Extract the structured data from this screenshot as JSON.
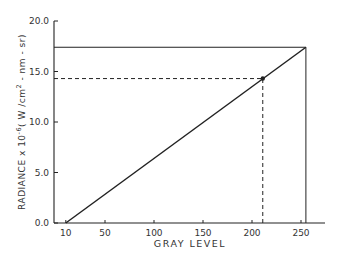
{
  "chart_data": {
    "type": "line",
    "title": "",
    "xlabel": "GRAY LEVEL",
    "ylabel": "RADIANCE x 10^-6 (W/cm^2-nm-sr)",
    "ylabel_parts": {
      "main": "RADIANCE x 10",
      "exp": "-6",
      "unit_open": "( W /cm",
      "unit_exp": "2",
      "unit_rest": " - nm - sr)"
    },
    "xlim": [
      0,
      270
    ],
    "ylim": [
      0,
      20
    ],
    "x_ticks": [
      10,
      50,
      100,
      150,
      200,
      250
    ],
    "x_tick_labels": [
      "10",
      "50",
      "100",
      "150",
      "200",
      "250"
    ],
    "y_ticks": [
      0,
      5,
      10,
      15,
      20
    ],
    "y_tick_labels": [
      "0.0",
      "5.0",
      "10.0",
      "15.0",
      "20.0"
    ],
    "grid": false,
    "legend": null,
    "series": [
      {
        "name": "calibration",
        "style": "solid",
        "x": [
          10,
          255
        ],
        "y": [
          0.0,
          17.4
        ]
      }
    ],
    "annotations": [
      {
        "type": "hline",
        "style": "solid",
        "y": 17.4,
        "x_from": 0,
        "x_to": 255
      },
      {
        "type": "vline",
        "style": "solid",
        "x": 255,
        "y_from": 0,
        "y_to": 17.4
      },
      {
        "type": "hline",
        "style": "dashed",
        "y": 14.3,
        "x_from": 0,
        "x_to": 211
      },
      {
        "type": "vline",
        "style": "dashed",
        "x": 211,
        "y_from": 0,
        "y_to": 14.3
      },
      {
        "type": "point",
        "x": 211,
        "y": 14.3
      }
    ]
  },
  "colors": {
    "ink": "#222222",
    "background": "#ffffff"
  }
}
